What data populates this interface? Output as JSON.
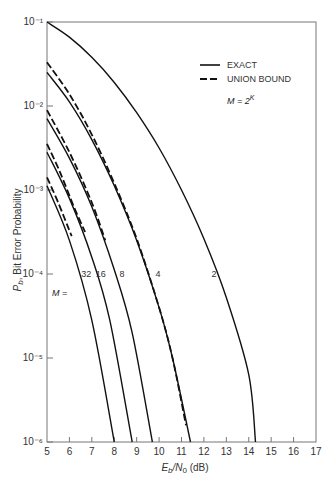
{
  "chart_data": {
    "type": "line",
    "title": "",
    "xlabel": "E_b/N_0 (dB)",
    "ylabel": "P_b, Bit Error Probability",
    "xlim": [
      5,
      17
    ],
    "ylim": [
      1e-06,
      0.1
    ],
    "yscale": "log",
    "grid": false,
    "x_ticks": [
      5,
      6,
      7,
      8,
      9,
      10,
      11,
      12,
      13,
      14,
      15,
      16,
      17
    ],
    "y_ticks": [
      {
        "v": -1,
        "label": "10⁻¹"
      },
      {
        "v": -2,
        "label": "10⁻²"
      },
      {
        "v": -3,
        "label": "10⁻³"
      },
      {
        "v": -4,
        "label": "10⁻⁴"
      },
      {
        "v": -5,
        "label": "10⁻⁵"
      },
      {
        "v": -6,
        "label": "10⁻⁶"
      }
    ],
    "legend": {
      "position": "upper right",
      "entries": [
        {
          "label": "EXACT",
          "style": "solid"
        },
        {
          "label": "UNION BOUND",
          "style": "dashed"
        }
      ]
    },
    "annotations": [
      {
        "text": "M = 2^K"
      },
      {
        "text": "M ="
      }
    ],
    "series": [
      {
        "name": "M=2",
        "label": "2",
        "style": "solid",
        "x": [
          5,
          6,
          7,
          8,
          9,
          10,
          11,
          12,
          13,
          14,
          14.3
        ],
        "log10_y": [
          -1,
          -1.18,
          -1.42,
          -1.72,
          -2.08,
          -2.5,
          -3.0,
          -3.58,
          -4.28,
          -5.2,
          -6
        ]
      },
      {
        "name": "M=4",
        "label": "4",
        "style": "solid",
        "x": [
          5,
          6,
          7,
          8,
          9,
          10,
          10.6,
          11.4
        ],
        "log10_y": [
          -1.6,
          -1.95,
          -2.4,
          -2.95,
          -3.6,
          -4.4,
          -5.0,
          -6
        ]
      },
      {
        "name": "M=4 union bound",
        "style": "dashed",
        "x": [
          5,
          6,
          7,
          8,
          9,
          10,
          10.6,
          11.2
        ],
        "log10_y": [
          -1.48,
          -1.86,
          -2.34,
          -2.92,
          -3.58,
          -4.4,
          -5.0,
          -5.8
        ]
      },
      {
        "name": "M=8",
        "label": "8",
        "style": "solid",
        "x": [
          5,
          6,
          7,
          8,
          8.8,
          9.7
        ],
        "log10_y": [
          -2.15,
          -2.62,
          -3.2,
          -3.95,
          -4.7,
          -6
        ]
      },
      {
        "name": "M=8 union bound",
        "style": "dashed",
        "x": [
          5,
          6,
          7,
          7.6
        ],
        "log10_y": [
          -2.05,
          -2.55,
          -3.15,
          -3.6
        ]
      },
      {
        "name": "M=16",
        "label": "16",
        "style": "solid",
        "x": [
          5,
          6,
          7,
          7.8,
          8.8
        ],
        "log10_y": [
          -2.55,
          -3.1,
          -3.8,
          -4.55,
          -6
        ]
      },
      {
        "name": "M=16 union bound",
        "style": "dashed",
        "x": [
          5,
          5.6,
          6.2,
          6.7
        ],
        "log10_y": [
          -2.45,
          -2.8,
          -3.2,
          -3.5
        ]
      },
      {
        "name": "M=32",
        "label": "32",
        "style": "solid",
        "x": [
          5,
          6,
          7,
          8
        ],
        "log10_y": [
          -2.95,
          -3.6,
          -4.55,
          -6
        ]
      },
      {
        "name": "M=32 union bound",
        "style": "dashed",
        "x": [
          5,
          5.5,
          6.1
        ],
        "log10_y": [
          -2.85,
          -3.15,
          -3.55
        ]
      }
    ],
    "curve_labels": [
      {
        "text": "32",
        "x": 6.75,
        "log10_y": -4
      },
      {
        "text": "16",
        "x": 7.4,
        "log10_y": -4
      },
      {
        "text": "8",
        "x": 8.35,
        "log10_y": -4
      },
      {
        "text": "4",
        "x": 9.95,
        "log10_y": -4
      },
      {
        "text": "2",
        "x": 12.45,
        "log10_y": -4
      }
    ]
  }
}
